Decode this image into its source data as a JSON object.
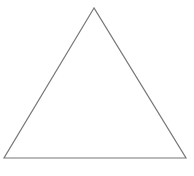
{
  "diagram": {
    "shape": "triangle",
    "vertices": {
      "apex": [
        94,
        8
      ],
      "bottom_left": [
        4,
        158
      ],
      "bottom_right": [
        186,
        158
      ]
    },
    "stroke_color": "#777777",
    "fill_color": "none",
    "background_color": "#ffffff"
  }
}
